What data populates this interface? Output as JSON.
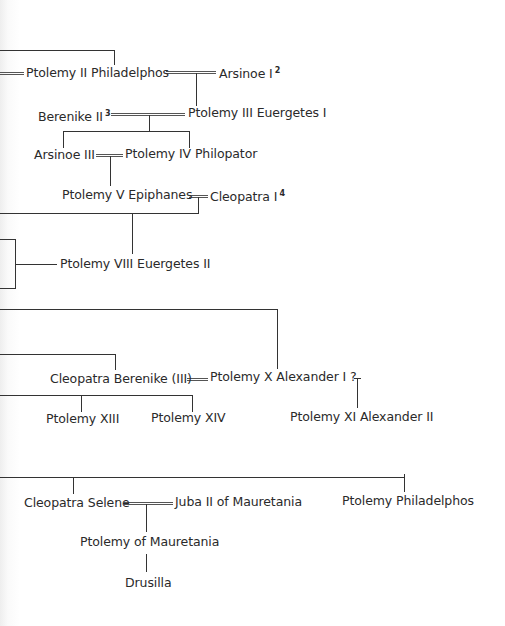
{
  "diagram": {
    "type": "family-tree",
    "title": "",
    "people": {
      "ptolemy_ii": {
        "name": "Ptolemy II Philadelphos",
        "note": ""
      },
      "arsinoe_i": {
        "name": "Arsinoe I",
        "note": "2"
      },
      "berenike_ii": {
        "name": "Berenike II",
        "note": "3"
      },
      "ptolemy_iii": {
        "name": "Ptolemy III Euergetes I",
        "note": ""
      },
      "arsinoe_iii": {
        "name": "Arsinoe III",
        "note": ""
      },
      "ptolemy_iv": {
        "name": "Ptolemy IV Philopator",
        "note": ""
      },
      "ptolemy_v": {
        "name": "Ptolemy V Epiphanes",
        "note": ""
      },
      "cleopatra_i": {
        "name": "Cleopatra I",
        "note": "4"
      },
      "ptolemy_viii": {
        "name": "Ptolemy VIII Euergetes II",
        "note": ""
      },
      "cleopatra_berenike": {
        "name": "Cleopatra Berenike (III)",
        "note": ""
      },
      "ptolemy_x": {
        "name": "Ptolemy X Alexander I ?",
        "note": ""
      },
      "ptolemy_xi": {
        "name": "Ptolemy XI Alexander II",
        "note": ""
      },
      "ptolemy_xiii": {
        "name": "Ptolemy XIII",
        "note": ""
      },
      "ptolemy_xiv": {
        "name": "Ptolemy XIV",
        "note": ""
      },
      "cleopatra_selene": {
        "name": "Cleopatra Selene",
        "note": ""
      },
      "juba_ii": {
        "name": "Juba II of Mauretania",
        "note": ""
      },
      "ptolemy_philadelphos": {
        "name": "Ptolemy Philadelphos",
        "note": ""
      },
      "ptolemy_of_mauretania": {
        "name": "Ptolemy of Mauretania",
        "note": ""
      },
      "drusilla": {
        "name": "Drusilla",
        "note": ""
      }
    },
    "marriages": [
      [
        "ptolemy_ii",
        "arsinoe_i"
      ],
      [
        "berenike_ii",
        "ptolemy_iii"
      ],
      [
        "arsinoe_iii",
        "ptolemy_iv"
      ],
      [
        "ptolemy_v",
        "cleopatra_i"
      ],
      [
        "cleopatra_berenike",
        "ptolemy_x"
      ],
      [
        "cleopatra_selene",
        "juba_ii"
      ]
    ],
    "descents": [
      {
        "parents": [
          "ptolemy_ii",
          "arsinoe_i"
        ],
        "children": [
          "ptolemy_iii"
        ]
      },
      {
        "parents": [
          "berenike_ii",
          "ptolemy_iii"
        ],
        "children": [
          "arsinoe_iii",
          "ptolemy_iv"
        ]
      },
      {
        "parents": [
          "arsinoe_iii",
          "ptolemy_iv"
        ],
        "children": [
          "ptolemy_v"
        ]
      },
      {
        "parents": [
          "ptolemy_v",
          "cleopatra_i"
        ],
        "children": [
          "ptolemy_viii"
        ]
      },
      {
        "parents": [
          "ptolemy_x"
        ],
        "children": [
          "ptolemy_xi"
        ]
      },
      {
        "parents": [
          "cleopatra_selene",
          "juba_ii"
        ],
        "children": [
          "ptolemy_of_mauretania"
        ]
      },
      {
        "parents": [
          "ptolemy_of_mauretania"
        ],
        "children": [
          "drusilla"
        ]
      }
    ]
  }
}
